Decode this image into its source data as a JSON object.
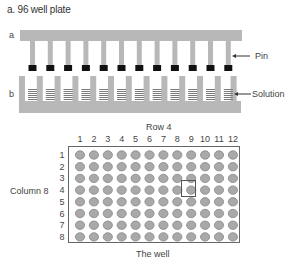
{
  "title": "a. 96 well plate",
  "pin_diagram": {
    "label_a": "a",
    "label_b": "b",
    "pin_label": "Pin",
    "solution_label": "Solution",
    "pin_count": 12,
    "colors": {
      "bar": "#b8b8b8",
      "pin_tip": "#111111",
      "plate": "#b8b8b8",
      "solution_lines": "#7a7a7a"
    }
  },
  "plate": {
    "row_header": "Row 4",
    "column_header": "Column 8",
    "caption": "The well",
    "column_numbers": [
      "1",
      "2",
      "3",
      "4",
      "5",
      "6",
      "7",
      "8",
      "9",
      "10",
      "11",
      "12"
    ],
    "row_numbers": [
      "1",
      "2",
      "3",
      "4",
      "5",
      "6",
      "7",
      "8"
    ],
    "highlight": {
      "row": 4,
      "column": 9
    },
    "colors": {
      "well_fill": "#a9a9a9",
      "well_stroke": "#888888",
      "border": "#666666"
    }
  }
}
